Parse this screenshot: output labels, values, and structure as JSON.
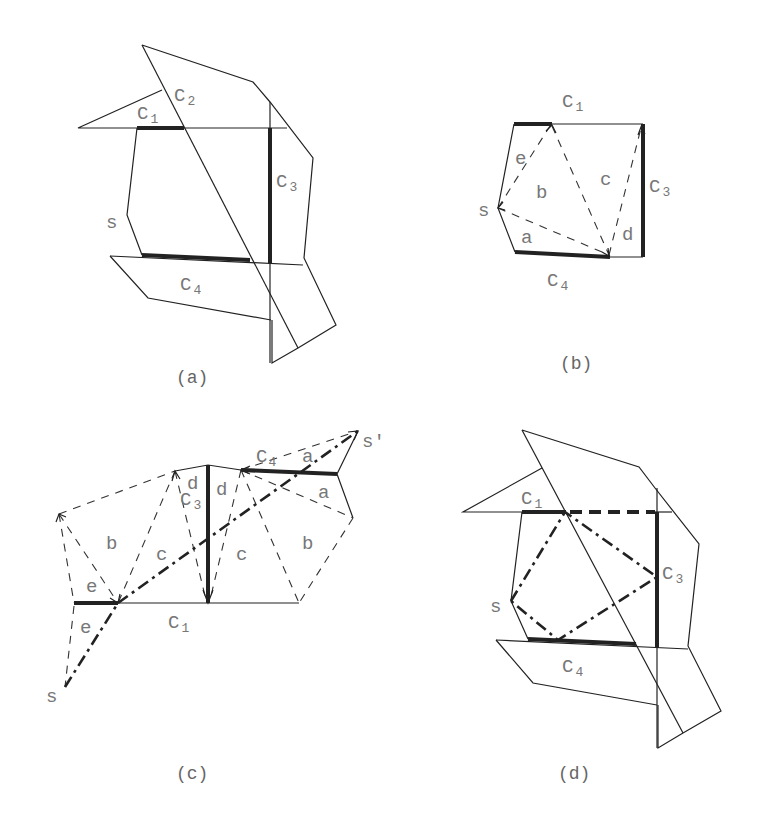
{
  "figure": {
    "panels": [
      {
        "id": "a",
        "caption": "(a)",
        "labels": {
          "c1": "C",
          "c1_sub": "1",
          "c2": "C",
          "c2_sub": "2",
          "c3": "C",
          "c3_sub": "3",
          "c4": "C",
          "c4_sub": "4",
          "s": "s"
        }
      },
      {
        "id": "b",
        "caption": "(b)",
        "labels": {
          "c1": "C",
          "c1_sub": "1",
          "c3": "C",
          "c3_sub": "3",
          "c4": "C",
          "c4_sub": "4",
          "s": "s",
          "regions": [
            "a",
            "b",
            "c",
            "d",
            "e"
          ]
        }
      },
      {
        "id": "c",
        "caption": "(c)",
        "labels": {
          "c1": "C",
          "c1_sub": "1",
          "c3": "C",
          "c3_sub": "3",
          "c4": "C",
          "c4_sub": "4",
          "s": "s",
          "s_prime": "s′",
          "regions": [
            "e",
            "e",
            "b",
            "c",
            "d",
            "d",
            "c",
            "b",
            "a",
            "a"
          ]
        }
      },
      {
        "id": "d",
        "caption": "(d)",
        "labels": {
          "c1": "C",
          "c1_sub": "1",
          "c3": "C",
          "c3_sub": "3",
          "c4": "C",
          "c4_sub": "4",
          "s": "s"
        }
      }
    ]
  }
}
